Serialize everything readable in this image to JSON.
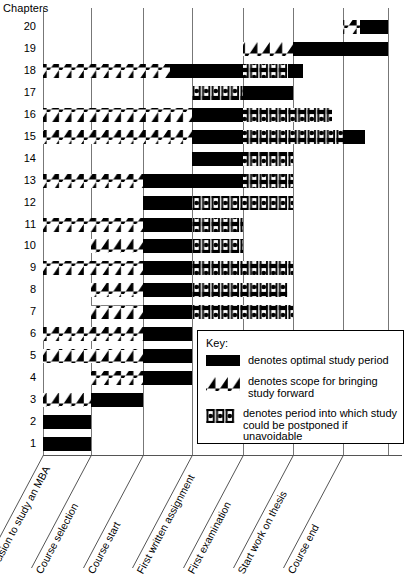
{
  "title": "Chapters",
  "legend": {
    "heading": "Key:",
    "entries": [
      {
        "swatch": "solid-black-bar",
        "text": "denotes optimal study period"
      },
      {
        "swatch": "hatched-bar",
        "text": "denotes scope for bringing study forward"
      },
      {
        "swatch": "dotted-bracket-bar",
        "text": "denotes period into which study could be postponed if unavoidable"
      }
    ]
  },
  "chart_data": {
    "type": "bar",
    "title": "Chapters",
    "xlabel": "",
    "ylabel": "Chapters",
    "grid": true,
    "legend_position": "inside-right",
    "milestones": [
      "Decision to study an MBA",
      "Course selection",
      "Course start",
      "First written assignment",
      "First examination",
      "Start work on thesis",
      "Course end"
    ],
    "milestone_x": [
      43,
      91,
      143,
      192,
      243,
      293,
      343
    ],
    "plot_right_x": 388,
    "categories": [
      "1",
      "2",
      "3",
      "4",
      "5",
      "6",
      "7",
      "8",
      "9",
      "10",
      "11",
      "12",
      "13",
      "14",
      "15",
      "16",
      "17",
      "18",
      "19",
      "20"
    ],
    "segment_types": {
      "solid": "optimal study period",
      "hatch": "scope for bringing study forward",
      "dot": "period into which study could be postponed if unavoidable"
    },
    "bars": [
      {
        "chapter": "20",
        "segments": [
          {
            "type": "hatch",
            "x0": 343,
            "x1": 360
          },
          {
            "type": "solid",
            "x0": 360,
            "x1": 388
          }
        ]
      },
      {
        "chapter": "19",
        "segments": [
          {
            "type": "hatch",
            "x0": 243,
            "x1": 293
          },
          {
            "type": "solid",
            "x0": 293,
            "x1": 388
          }
        ]
      },
      {
        "chapter": "18",
        "segments": [
          {
            "type": "hatch",
            "x0": 43,
            "x1": 170
          },
          {
            "type": "solid",
            "x0": 170,
            "x1": 243
          },
          {
            "type": "dot",
            "x0": 243,
            "x1": 288
          },
          {
            "type": "solid",
            "x0": 288,
            "x1": 303
          }
        ]
      },
      {
        "chapter": "17",
        "segments": [
          {
            "type": "dot",
            "x0": 192,
            "x1": 243
          },
          {
            "type": "solid",
            "x0": 243,
            "x1": 293
          }
        ]
      },
      {
        "chapter": "16",
        "segments": [
          {
            "type": "hatch",
            "x0": 43,
            "x1": 192
          },
          {
            "type": "solid",
            "x0": 192,
            "x1": 243
          },
          {
            "type": "dot",
            "x0": 243,
            "x1": 332
          }
        ]
      },
      {
        "chapter": "15",
        "segments": [
          {
            "type": "hatch",
            "x0": 43,
            "x1": 192
          },
          {
            "type": "solid",
            "x0": 192,
            "x1": 243
          },
          {
            "type": "dot",
            "x0": 243,
            "x1": 343
          },
          {
            "type": "solid",
            "x0": 343,
            "x1": 365
          }
        ]
      },
      {
        "chapter": "14",
        "segments": [
          {
            "type": "solid",
            "x0": 192,
            "x1": 243
          },
          {
            "type": "dot",
            "x0": 243,
            "x1": 293
          }
        ]
      },
      {
        "chapter": "13",
        "segments": [
          {
            "type": "hatch",
            "x0": 43,
            "x1": 143
          },
          {
            "type": "solid",
            "x0": 143,
            "x1": 243
          },
          {
            "type": "dot",
            "x0": 243,
            "x1": 293
          }
        ]
      },
      {
        "chapter": "12",
        "segments": [
          {
            "type": "solid",
            "x0": 143,
            "x1": 192
          },
          {
            "type": "dot",
            "x0": 192,
            "x1": 293
          }
        ]
      },
      {
        "chapter": "11",
        "segments": [
          {
            "type": "hatch",
            "x0": 43,
            "x1": 143
          },
          {
            "type": "solid",
            "x0": 143,
            "x1": 192
          },
          {
            "type": "dot",
            "x0": 192,
            "x1": 243
          }
        ]
      },
      {
        "chapter": "10",
        "segments": [
          {
            "type": "hatch",
            "x0": 91,
            "x1": 143
          },
          {
            "type": "solid",
            "x0": 143,
            "x1": 192
          },
          {
            "type": "dot",
            "x0": 192,
            "x1": 243
          }
        ]
      },
      {
        "chapter": "9",
        "segments": [
          {
            "type": "hatch",
            "x0": 43,
            "x1": 143
          },
          {
            "type": "solid",
            "x0": 143,
            "x1": 192
          },
          {
            "type": "dot",
            "x0": 192,
            "x1": 293
          }
        ]
      },
      {
        "chapter": "8",
        "segments": [
          {
            "type": "hatch",
            "x0": 91,
            "x1": 143
          },
          {
            "type": "solid",
            "x0": 143,
            "x1": 192
          },
          {
            "type": "dot",
            "x0": 192,
            "x1": 288
          }
        ]
      },
      {
        "chapter": "7",
        "segments": [
          {
            "type": "hatch",
            "x0": 91,
            "x1": 143
          },
          {
            "type": "solid",
            "x0": 143,
            "x1": 192
          },
          {
            "type": "dot",
            "x0": 192,
            "x1": 293
          }
        ]
      },
      {
        "chapter": "6",
        "segments": [
          {
            "type": "hatch",
            "x0": 43,
            "x1": 143
          },
          {
            "type": "solid",
            "x0": 143,
            "x1": 192
          }
        ]
      },
      {
        "chapter": "5",
        "segments": [
          {
            "type": "hatch",
            "x0": 43,
            "x1": 143
          },
          {
            "type": "solid",
            "x0": 143,
            "x1": 192
          }
        ]
      },
      {
        "chapter": "4",
        "segments": [
          {
            "type": "hatch",
            "x0": 91,
            "x1": 143
          },
          {
            "type": "solid",
            "x0": 143,
            "x1": 192
          }
        ]
      },
      {
        "chapter": "3",
        "segments": [
          {
            "type": "hatch",
            "x0": 43,
            "x1": 91
          },
          {
            "type": "solid",
            "x0": 91,
            "x1": 143
          }
        ]
      },
      {
        "chapter": "2",
        "segments": [
          {
            "type": "solid",
            "x0": 43,
            "x1": 91
          }
        ]
      },
      {
        "chapter": "1",
        "segments": [
          {
            "type": "solid",
            "x0": 43,
            "x1": 91
          }
        ]
      }
    ]
  }
}
